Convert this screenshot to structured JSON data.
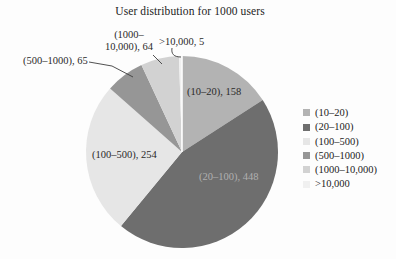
{
  "chart_title": "User distribution for 1000 users",
  "chart_data": {
    "type": "pie",
    "title": "User distribution for 1000 users",
    "categories": [
      "(10–20)",
      "(20–100)",
      "(100–500)",
      "(500–1000)",
      "(1000–10,000)",
      ">10,000"
    ],
    "values": [
      158,
      448,
      254,
      65,
      64,
      5
    ],
    "colors": [
      "#b3b3b3",
      "#6e6e6e",
      "#e6e6e6",
      "#969696",
      "#d2d2d2",
      "#f0f0f0"
    ],
    "start_angle_deg": 0,
    "direction": "clockwise",
    "legend_position": "right",
    "grid": false,
    "total_users": 1000
  },
  "slice_labels": {
    "s10_20": "(10–20), 158",
    "s20_100": "(20–100), 448",
    "s100_500": "(100–500), 254",
    "s500_1000": "(500–1000), 65",
    "s1000_10000_line1": "(1000–",
    "s1000_10000_line2": "10,000), 64",
    "sgt10000": ">10,000, 5"
  }
}
